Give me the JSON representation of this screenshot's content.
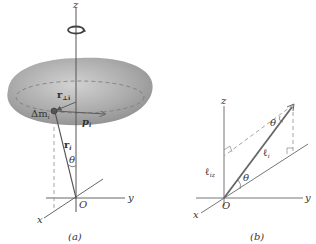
{
  "panel_a": {
    "caption": "(a)",
    "labels": {
      "z": "z",
      "y": "y",
      "x": "x",
      "origin": "O",
      "mass": "Δm",
      "mass_sub": "i",
      "r_perp": "r",
      "r_perp_sub": "⊥i",
      "p": "p",
      "p_sub": "i",
      "r": "r",
      "r_sub": "i",
      "theta": "θ"
    }
  },
  "panel_b": {
    "caption": "(b)",
    "labels": {
      "z": "z",
      "y": "y",
      "x": "x",
      "origin": "O",
      "l": "ℓ",
      "l_sub": "i",
      "lz": "ℓ",
      "lz_sub": "iz",
      "theta_top": "θ",
      "theta_bottom": "θ"
    }
  },
  "colors": {
    "body_fill": "#a8a8a8",
    "line": "#555555",
    "dashed": "#999999"
  }
}
